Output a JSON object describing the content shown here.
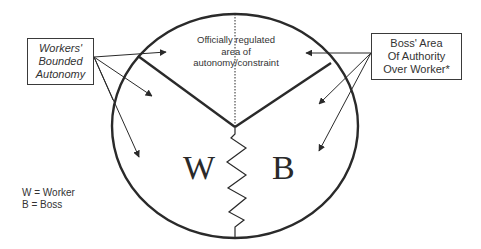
{
  "diagram": {
    "center_label": [
      "Officially regulated",
      "area of",
      "autonomy/constraint"
    ],
    "left_box": [
      "Workers'",
      "Bounded",
      "Autonomy"
    ],
    "right_box": [
      "Boss' Area",
      "Of Authority",
      "Over Worker*"
    ],
    "worker_letter": "W",
    "boss_letter": "B",
    "legend": [
      "W = Worker",
      "B = Boss"
    ],
    "colors": {
      "line": "#2a2a2a",
      "background": "#ffffff"
    }
  }
}
